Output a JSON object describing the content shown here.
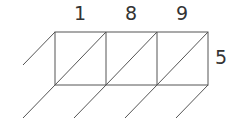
{
  "diagram": {
    "type": "lattice-multiplication-grid",
    "top_digits": [
      "1",
      "8",
      "9"
    ],
    "right_digits": [
      "5"
    ],
    "columns": 3,
    "rows": 1,
    "line_color": "#555555",
    "digit_color": "#333333"
  }
}
